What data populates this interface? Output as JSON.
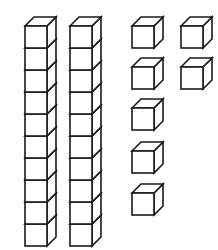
{
  "figure": {
    "title": "Base-ten blocks",
    "background_color": "#ffffff",
    "line_color": "#1a1a1a",
    "fill_color": "#ffffff",
    "line_width": 1.6
  },
  "chart_data": {
    "type": "table",
    "title": "Base-ten blocks",
    "xlabel": "",
    "ylabel": "",
    "categories": [
      "tens-rods",
      "unit-cubes"
    ],
    "values": [
      2,
      7
    ],
    "groups": [
      {
        "name": "tens-rods",
        "label": "Tens rods",
        "count": 2,
        "cubes_per_item": 10,
        "total_units": 20
      },
      {
        "name": "unit-cubes",
        "label": "Unit cubes",
        "count": 7,
        "cubes_per_item": 1,
        "total_units": 7
      }
    ],
    "total_value": 27
  },
  "geometry": {
    "cube_size": 22,
    "depth_x": 9,
    "depth_y": 9,
    "rods": [
      {
        "name": "tens-rod-1",
        "x": 25,
        "y": 26,
        "cubes": 10
      },
      {
        "name": "tens-rod-2",
        "x": 70,
        "y": 26,
        "cubes": 10
      }
    ],
    "units": [
      {
        "name": "unit-cube-1",
        "x": 132,
        "y": 26
      },
      {
        "name": "unit-cube-2",
        "x": 181,
        "y": 26
      },
      {
        "name": "unit-cube-3",
        "x": 132,
        "y": 67
      },
      {
        "name": "unit-cube-4",
        "x": 181,
        "y": 67
      },
      {
        "name": "unit-cube-5",
        "x": 132,
        "y": 108
      },
      {
        "name": "unit-cube-6",
        "x": 132,
        "y": 151
      },
      {
        "name": "unit-cube-7",
        "x": 132,
        "y": 193
      }
    ]
  }
}
